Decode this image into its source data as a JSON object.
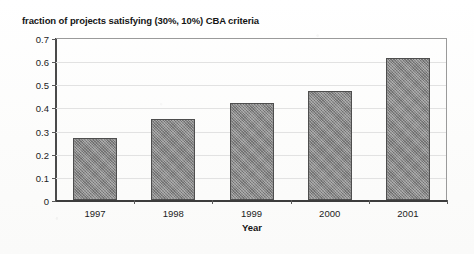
{
  "chart_data": {
    "type": "bar",
    "title": "fraction of projects satisfying (30%, 10%) CBA criteria",
    "xlabel": "Year",
    "ylabel": "",
    "categories": [
      "1997",
      "1998",
      "1999",
      "2000",
      "2001"
    ],
    "values": [
      0.27,
      0.35,
      0.42,
      0.47,
      0.615
    ],
    "ylim": [
      0,
      0.7
    ],
    "ytick_values": [
      0,
      0.1,
      0.2,
      0.3,
      0.4,
      0.5,
      0.6,
      0.7
    ],
    "ytick_labels": [
      "0",
      "0.1",
      "0.2",
      "0.3",
      "0.4",
      "0.5",
      "0.6",
      "0.7"
    ],
    "grid": true,
    "legend": false,
    "legend_position": "none",
    "series": [
      {
        "name": "fraction of projects satisfying (30%, 10%) CBA criteria",
        "color": "#878787",
        "values": [
          0.27,
          0.35,
          0.42,
          0.47,
          0.615
        ]
      }
    ]
  },
  "axes": {
    "y_labels": [
      "0.7",
      "0.6",
      "0.5",
      "0.4",
      "0.3",
      "0.2",
      "0.1",
      "0"
    ],
    "x_labels": [
      "1997",
      "1998",
      "1999",
      "2000",
      "2001"
    ],
    "x_title": "Year"
  },
  "colors": {
    "bar_fill": "#878787",
    "bar_border": "#4e4e4e",
    "gridline": "#e2e2e2",
    "axis": "#3c3c3c",
    "text": "#1c1c1c",
    "background": "#fdfdfd"
  }
}
